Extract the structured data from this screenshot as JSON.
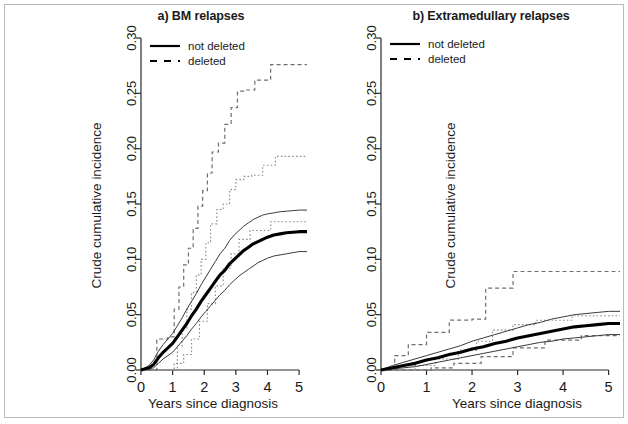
{
  "figure": {
    "ylabel": "Crude cumulative incidence",
    "xlabel": "Years since diagnosis",
    "legend": {
      "not_deleted": "not deleted",
      "deleted": "deleted"
    },
    "colors": {
      "main_curve": "#000000",
      "ci_curve": "#3a3a3a",
      "dashed_curve": "#6f6f6f",
      "axis": "#2b2b2b",
      "background": "#ffffff"
    }
  },
  "panels": [
    {
      "id": "a",
      "title": "a) BM relapses"
    },
    {
      "id": "b",
      "title": "b) Extramedullary relapses"
    }
  ],
  "axis_ticks": {
    "y": [
      "0.00",
      "0.05",
      "0.10",
      "0.15",
      "0.20",
      "0.25",
      "0.30"
    ],
    "x": [
      "0",
      "1",
      "2",
      "3",
      "4",
      "5"
    ]
  },
  "chart_data": [
    {
      "type": "line",
      "title": "a) BM relapses",
      "xlabel": "Years since diagnosis",
      "ylabel": "Crude cumulative incidence",
      "xlim": [
        0,
        5.25
      ],
      "ylim": [
        0.0,
        0.3
      ],
      "xticks": [
        0,
        1,
        2,
        3,
        4,
        5
      ],
      "yticks": [
        0.0,
        0.05,
        0.1,
        0.15,
        0.2,
        0.25,
        0.3
      ],
      "grid": false,
      "legend_position": "top-left",
      "series": [
        {
          "name": "not deleted",
          "style": "solid",
          "linewidth": "thick",
          "x": [
            0.0,
            0.25,
            0.4,
            0.55,
            0.7,
            0.85,
            1.0,
            1.15,
            1.3,
            1.45,
            1.6,
            1.75,
            1.9,
            2.05,
            2.2,
            2.35,
            2.5,
            2.65,
            2.8,
            2.95,
            3.1,
            3.25,
            3.4,
            3.55,
            3.7,
            3.85,
            4.0,
            4.2,
            4.4,
            4.6,
            4.8,
            5.0,
            5.25
          ],
          "y": [
            0.0,
            0.002,
            0.005,
            0.011,
            0.016,
            0.02,
            0.024,
            0.03,
            0.036,
            0.042,
            0.049,
            0.055,
            0.062,
            0.068,
            0.074,
            0.08,
            0.086,
            0.09,
            0.096,
            0.1,
            0.104,
            0.108,
            0.111,
            0.114,
            0.116,
            0.118,
            0.12,
            0.122,
            0.123,
            0.124,
            0.1245,
            0.125,
            0.125
          ]
        },
        {
          "name": "not deleted upper CI",
          "style": "solid",
          "linewidth": "thin",
          "x": [
            0.0,
            0.25,
            0.4,
            0.55,
            0.7,
            0.85,
            1.0,
            1.15,
            1.3,
            1.45,
            1.6,
            1.75,
            1.9,
            2.05,
            2.2,
            2.35,
            2.5,
            2.65,
            2.8,
            2.95,
            3.1,
            3.25,
            3.4,
            3.55,
            3.7,
            3.85,
            4.0,
            4.2,
            4.4,
            4.6,
            4.8,
            5.0,
            5.25
          ],
          "y": [
            0.0,
            0.004,
            0.009,
            0.017,
            0.023,
            0.028,
            0.033,
            0.04,
            0.047,
            0.055,
            0.062,
            0.069,
            0.077,
            0.084,
            0.091,
            0.098,
            0.105,
            0.11,
            0.117,
            0.122,
            0.126,
            0.13,
            0.133,
            0.136,
            0.138,
            0.14,
            0.141,
            0.142,
            0.143,
            0.1435,
            0.144,
            0.1445,
            0.1445
          ]
        },
        {
          "name": "not deleted lower CI",
          "style": "solid",
          "linewidth": "thin",
          "x": [
            0.0,
            0.25,
            0.4,
            0.55,
            0.7,
            0.85,
            1.0,
            1.15,
            1.3,
            1.45,
            1.6,
            1.75,
            1.9,
            2.05,
            2.2,
            2.35,
            2.5,
            2.65,
            2.8,
            2.95,
            3.1,
            3.25,
            3.4,
            3.55,
            3.7,
            3.85,
            4.0,
            4.2,
            4.4,
            4.6,
            4.8,
            5.0,
            5.25
          ],
          "y": [
            0.0,
            0.001,
            0.002,
            0.006,
            0.01,
            0.013,
            0.016,
            0.021,
            0.026,
            0.031,
            0.037,
            0.042,
            0.048,
            0.053,
            0.058,
            0.063,
            0.068,
            0.072,
            0.077,
            0.081,
            0.085,
            0.088,
            0.091,
            0.094,
            0.097,
            0.099,
            0.101,
            0.103,
            0.104,
            0.105,
            0.106,
            0.107,
            0.107
          ]
        },
        {
          "name": "deleted",
          "style": "dashed",
          "linewidth": "thin",
          "step": true,
          "x": [
            0.0,
            0.5,
            0.5,
            0.85,
            0.85,
            1.05,
            1.05,
            1.2,
            1.2,
            1.35,
            1.35,
            1.5,
            1.5,
            1.65,
            1.65,
            1.8,
            1.8,
            1.95,
            1.95,
            2.1,
            2.1,
            2.25,
            2.25,
            2.45,
            2.45,
            2.65,
            2.65,
            2.85,
            2.85,
            3.05,
            3.05,
            3.3,
            3.3,
            3.6,
            3.6,
            4.1,
            4.1,
            5.25
          ],
          "y": [
            0.0,
            0.0,
            0.028,
            0.028,
            0.03,
            0.03,
            0.055,
            0.055,
            0.075,
            0.075,
            0.095,
            0.095,
            0.11,
            0.11,
            0.128,
            0.128,
            0.148,
            0.148,
            0.162,
            0.162,
            0.178,
            0.178,
            0.197,
            0.197,
            0.205,
            0.205,
            0.222,
            0.222,
            0.237,
            0.237,
            0.252,
            0.252,
            0.253,
            0.253,
            0.262,
            0.262,
            0.276,
            0.276
          ]
        },
        {
          "name": "deleted upper CI",
          "style": "dotted",
          "linewidth": "thin",
          "step": true,
          "x": [
            0.0,
            1.15,
            1.15,
            1.3,
            1.3,
            1.45,
            1.45,
            1.6,
            1.6,
            1.75,
            1.75,
            1.9,
            1.9,
            2.05,
            2.05,
            2.2,
            2.2,
            2.4,
            2.4,
            2.6,
            2.6,
            2.8,
            2.8,
            3.0,
            3.0,
            3.25,
            3.25,
            3.5,
            3.5,
            3.85,
            3.85,
            4.25,
            4.25,
            5.25
          ],
          "y": [
            0.0,
            0.0,
            0.022,
            0.022,
            0.038,
            0.038,
            0.055,
            0.055,
            0.07,
            0.07,
            0.086,
            0.086,
            0.1,
            0.1,
            0.115,
            0.115,
            0.132,
            0.132,
            0.145,
            0.145,
            0.15,
            0.15,
            0.163,
            0.163,
            0.172,
            0.172,
            0.175,
            0.175,
            0.176,
            0.176,
            0.185,
            0.185,
            0.193,
            0.193
          ]
        },
        {
          "name": "deleted lower CI",
          "style": "dotted",
          "linewidth": "thin",
          "step": true,
          "x": [
            0.0,
            1.05,
            1.05,
            1.35,
            1.35,
            1.6,
            1.6,
            1.85,
            1.85,
            2.1,
            2.1,
            2.35,
            2.35,
            2.6,
            2.6,
            2.85,
            2.85,
            3.1,
            3.1,
            3.45,
            3.45,
            4.1,
            4.1,
            5.25
          ],
          "y": [
            0.0,
            0.0,
            0.006,
            0.006,
            0.014,
            0.014,
            0.028,
            0.028,
            0.044,
            0.044,
            0.06,
            0.06,
            0.076,
            0.076,
            0.092,
            0.092,
            0.105,
            0.105,
            0.118,
            0.118,
            0.126,
            0.126,
            0.134,
            0.134
          ]
        }
      ]
    },
    {
      "type": "line",
      "title": "b) Extramedullary relapses",
      "xlabel": "Years since diagnosis",
      "ylabel": "Crude cumulative incidence",
      "xlim": [
        0,
        5.25
      ],
      "ylim": [
        0.0,
        0.3
      ],
      "xticks": [
        0,
        1,
        2,
        3,
        4,
        5
      ],
      "yticks": [
        0.0,
        0.05,
        0.1,
        0.15,
        0.2,
        0.25,
        0.3
      ],
      "grid": false,
      "legend_position": "top-left",
      "series": [
        {
          "name": "not deleted",
          "style": "solid",
          "linewidth": "thick",
          "x": [
            0.0,
            0.25,
            0.5,
            0.75,
            1.0,
            1.25,
            1.5,
            1.75,
            2.0,
            2.25,
            2.5,
            2.75,
            3.0,
            3.25,
            3.5,
            3.75,
            4.0,
            4.25,
            4.5,
            4.75,
            5.0,
            5.25
          ],
          "y": [
            0.0,
            0.002,
            0.004,
            0.006,
            0.009,
            0.011,
            0.014,
            0.016,
            0.019,
            0.021,
            0.024,
            0.026,
            0.029,
            0.031,
            0.033,
            0.035,
            0.037,
            0.039,
            0.04,
            0.041,
            0.042,
            0.042
          ]
        },
        {
          "name": "not deleted upper CI",
          "style": "solid",
          "linewidth": "thin",
          "x": [
            0.0,
            0.25,
            0.5,
            0.75,
            1.0,
            1.25,
            1.5,
            1.75,
            2.0,
            2.25,
            2.5,
            2.75,
            3.0,
            3.25,
            3.5,
            3.75,
            4.0,
            4.25,
            4.5,
            4.75,
            5.0,
            5.25
          ],
          "y": [
            0.0,
            0.004,
            0.007,
            0.01,
            0.013,
            0.016,
            0.019,
            0.022,
            0.026,
            0.029,
            0.032,
            0.035,
            0.038,
            0.041,
            0.043,
            0.046,
            0.048,
            0.05,
            0.051,
            0.052,
            0.053,
            0.053
          ]
        },
        {
          "name": "not deleted lower CI",
          "style": "solid",
          "linewidth": "thin",
          "x": [
            0.0,
            0.25,
            0.5,
            0.75,
            1.0,
            1.25,
            1.5,
            1.75,
            2.0,
            2.25,
            2.5,
            2.75,
            3.0,
            3.25,
            3.5,
            3.75,
            4.0,
            4.25,
            4.5,
            4.75,
            5.0,
            5.25
          ],
          "y": [
            0.0,
            0.001,
            0.002,
            0.003,
            0.005,
            0.007,
            0.009,
            0.011,
            0.013,
            0.015,
            0.017,
            0.019,
            0.021,
            0.023,
            0.025,
            0.026,
            0.028,
            0.029,
            0.03,
            0.031,
            0.032,
            0.032
          ]
        },
        {
          "name": "deleted",
          "style": "dashed",
          "linewidth": "thin",
          "step": true,
          "x": [
            0.0,
            0.3,
            0.3,
            0.6,
            0.6,
            1.0,
            1.0,
            1.5,
            1.5,
            2.0,
            2.0,
            2.3,
            2.3,
            2.9,
            2.9,
            5.25
          ],
          "y": [
            0.0,
            0.0,
            0.013,
            0.013,
            0.023,
            0.023,
            0.034,
            0.034,
            0.045,
            0.045,
            0.046,
            0.046,
            0.074,
            0.074,
            0.089,
            0.089
          ]
        },
        {
          "name": "deleted upper CI",
          "style": "dotted",
          "linewidth": "thin",
          "step": true,
          "x": [
            0.0,
            0.75,
            0.75,
            1.2,
            1.2,
            1.7,
            1.7,
            2.1,
            2.1,
            2.45,
            2.45,
            2.9,
            2.9,
            3.4,
            3.4,
            4.2,
            4.2,
            5.25
          ],
          "y": [
            0.0,
            0.0,
            0.004,
            0.004,
            0.01,
            0.01,
            0.018,
            0.018,
            0.026,
            0.026,
            0.036,
            0.036,
            0.041,
            0.041,
            0.045,
            0.045,
            0.049,
            0.049
          ]
        },
        {
          "name": "deleted lower CI",
          "style": "dashed",
          "linewidth": "thin",
          "step": true,
          "x": [
            0.0,
            1.1,
            1.1,
            1.6,
            1.6,
            2.2,
            2.2,
            2.9,
            2.9,
            3.6,
            3.6,
            4.4,
            4.4,
            5.25
          ],
          "y": [
            0.0,
            0.0,
            0.002,
            0.002,
            0.006,
            0.006,
            0.012,
            0.012,
            0.02,
            0.02,
            0.027,
            0.027,
            0.031,
            0.031
          ]
        }
      ]
    }
  ]
}
